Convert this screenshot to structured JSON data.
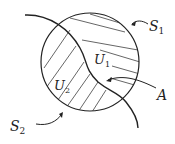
{
  "diagram": {
    "labels": {
      "S1": {
        "main": "S",
        "sub": "1"
      },
      "S2": {
        "main": "S",
        "sub": "2"
      },
      "U1": {
        "main": "U",
        "sub": "1"
      },
      "U2": {
        "main": "U",
        "sub": "2"
      },
      "A": {
        "main": "A"
      }
    },
    "colors": {
      "stroke": "#222222",
      "hatch": "#555555",
      "background": "#ffffff"
    }
  }
}
